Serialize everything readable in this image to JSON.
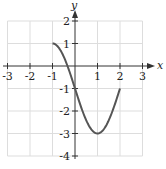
{
  "chart_data": {
    "type": "line",
    "title": "",
    "xlabel": "x",
    "ylabel": "y",
    "xlim": [
      -3,
      3
    ],
    "ylim": [
      -4,
      2
    ],
    "grid": true,
    "x_ticks": [
      -3,
      -2,
      -1,
      1,
      2,
      3
    ],
    "y_ticks": [
      2,
      1,
      -1,
      -2,
      -3,
      -4
    ],
    "x_tick_labels": [
      "-3",
      "-2",
      "-1",
      "1",
      "2",
      "3"
    ],
    "y_tick_labels": [
      "2",
      "1",
      "-1",
      "-2",
      "-3",
      "-4"
    ],
    "series": [
      {
        "name": "f(x)",
        "domain": [
          -1,
          2
        ],
        "x": [
          -1,
          -0.5,
          0,
          0.5,
          1,
          1.5,
          2
        ],
        "y": [
          1,
          0.41,
          -1,
          -2.41,
          -3,
          -2.41,
          -1
        ]
      }
    ],
    "colors": {
      "curve": "#555555",
      "grid": "#dddddd",
      "axis": "#333333"
    }
  }
}
